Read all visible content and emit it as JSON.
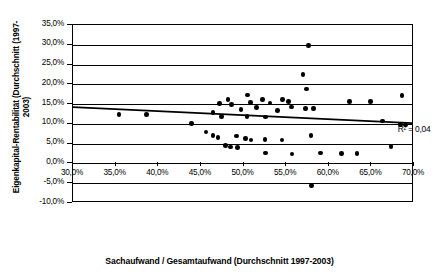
{
  "chart_data": {
    "type": "scatter",
    "title": "",
    "xlabel": "Sachaufwand / Gesamtaufwand (Durchschnitt 1997-2003)",
    "ylabel": "Eigenkapital-Rentabilität (Durchschnitt (1997-2003)",
    "xlim": [
      30,
      70
    ],
    "ylim": [
      -10,
      35
    ],
    "xticks": [
      30,
      35,
      40,
      45,
      50,
      55,
      60,
      65,
      70
    ],
    "yticks": [
      -10,
      -5,
      0,
      5,
      10,
      15,
      20,
      25,
      30,
      35
    ],
    "xtick_labels": [
      "30,0%",
      "35,0%",
      "40,0%",
      "45,0%",
      "50,0%",
      "55,0%",
      "60,0%",
      "65,0%",
      "70,0%"
    ],
    "ytick_labels": [
      "-10,0%",
      "-5,0%",
      "0,0%",
      "5,0%",
      "10,0%",
      "15,0%",
      "20,0%",
      "25,0%",
      "30,0%",
      "35,0%"
    ],
    "grid": "horizontal",
    "legend": "none",
    "marker_color": "#000000",
    "trendline_color": "#000000",
    "annotations": [
      {
        "text": "R² = 0,04",
        "x": 68.2,
        "y": 10.0
      }
    ],
    "trendline": {
      "type": "linear",
      "x_start": 30.0,
      "y_start": 14.0,
      "x_end": 70.0,
      "y_end": 9.9,
      "r_squared": 0.04
    },
    "points": [
      {
        "x": 35.4,
        "y": 12.4
      },
      {
        "x": 38.6,
        "y": 12.3
      },
      {
        "x": 43.9,
        "y": 10.1
      },
      {
        "x": 45.6,
        "y": 8.0
      },
      {
        "x": 46.4,
        "y": 7.0
      },
      {
        "x": 47.0,
        "y": 6.5
      },
      {
        "x": 47.2,
        "y": 15.2
      },
      {
        "x": 46.4,
        "y": 12.9
      },
      {
        "x": 47.4,
        "y": 11.8
      },
      {
        "x": 48.2,
        "y": 16.2
      },
      {
        "x": 48.6,
        "y": 14.9
      },
      {
        "x": 49.2,
        "y": 6.9
      },
      {
        "x": 47.9,
        "y": 4.5
      },
      {
        "x": 48.5,
        "y": 4.2
      },
      {
        "x": 49.3,
        "y": 4.0
      },
      {
        "x": 49.7,
        "y": 13.6
      },
      {
        "x": 50.4,
        "y": 11.9
      },
      {
        "x": 50.5,
        "y": 17.3
      },
      {
        "x": 50.8,
        "y": 15.4
      },
      {
        "x": 50.2,
        "y": 6.3
      },
      {
        "x": 50.9,
        "y": 5.9
      },
      {
        "x": 51.5,
        "y": 14.2
      },
      {
        "x": 52.2,
        "y": 16.1
      },
      {
        "x": 52.6,
        "y": 11.7
      },
      {
        "x": 53.1,
        "y": 15.3
      },
      {
        "x": 52.5,
        "y": 6.1
      },
      {
        "x": 52.6,
        "y": 2.6
      },
      {
        "x": 54.0,
        "y": 13.4
      },
      {
        "x": 54.6,
        "y": 16.2
      },
      {
        "x": 54.5,
        "y": 5.9
      },
      {
        "x": 55.3,
        "y": 15.6
      },
      {
        "x": 55.6,
        "y": 14.3
      },
      {
        "x": 55.7,
        "y": 2.4
      },
      {
        "x": 57.0,
        "y": 22.5
      },
      {
        "x": 57.4,
        "y": 18.8
      },
      {
        "x": 57.6,
        "y": 29.8
      },
      {
        "x": 57.3,
        "y": 13.9
      },
      {
        "x": 58.2,
        "y": 13.9
      },
      {
        "x": 57.9,
        "y": 7.0
      },
      {
        "x": 58.0,
        "y": -5.6
      },
      {
        "x": 59.0,
        "y": 2.6
      },
      {
        "x": 62.4,
        "y": 15.6
      },
      {
        "x": 61.5,
        "y": 2.5
      },
      {
        "x": 63.3,
        "y": 2.5
      },
      {
        "x": 64.9,
        "y": 15.6
      },
      {
        "x": 66.3,
        "y": 10.7
      },
      {
        "x": 67.3,
        "y": 4.3
      },
      {
        "x": 68.6,
        "y": 17.2
      },
      {
        "x": 68.4,
        "y": 9.8
      },
      {
        "x": 69.0,
        "y": 9.7
      }
    ]
  }
}
